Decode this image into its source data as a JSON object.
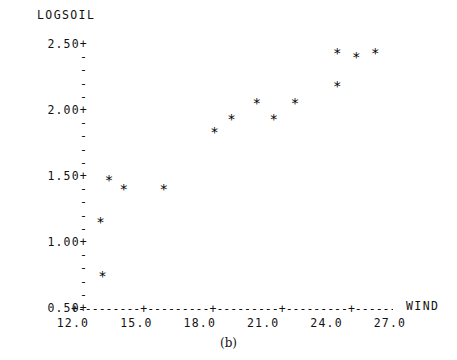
{
  "chart_data": {
    "type": "scatter",
    "title": "",
    "xlabel": "WIND",
    "ylabel": "LOGSOIL",
    "xlim": [
      12.0,
      27.0
    ],
    "ylim": [
      0.5,
      2.5
    ],
    "grid": false,
    "legend": null,
    "point_marker": "*",
    "x": [
      13.4,
      13.3,
      13.7,
      14.4,
      16.3,
      18.7,
      19.5,
      20.7,
      21.5,
      22.5,
      24.5,
      24.5,
      25.4,
      26.3
    ],
    "y": [
      0.74,
      1.15,
      1.47,
      1.4,
      1.4,
      1.83,
      1.93,
      2.05,
      1.93,
      2.05,
      2.18,
      2.43,
      2.4,
      2.43
    ],
    "points": [
      {
        "x": 13.4,
        "y": 0.74
      },
      {
        "x": 13.3,
        "y": 1.15
      },
      {
        "x": 13.7,
        "y": 1.47
      },
      {
        "x": 14.4,
        "y": 1.4
      },
      {
        "x": 16.3,
        "y": 1.4
      },
      {
        "x": 18.7,
        "y": 1.83
      },
      {
        "x": 19.5,
        "y": 1.93
      },
      {
        "x": 20.7,
        "y": 2.05
      },
      {
        "x": 21.5,
        "y": 1.93
      },
      {
        "x": 22.5,
        "y": 2.05
      },
      {
        "x": 24.5,
        "y": 2.18
      },
      {
        "x": 24.5,
        "y": 2.43
      },
      {
        "x": 25.4,
        "y": 2.4
      },
      {
        "x": 26.3,
        "y": 2.43
      }
    ],
    "xticks": [
      12.0,
      15.0,
      18.0,
      21.0,
      24.0,
      27.0
    ],
    "xticklabels": [
      "12.0",
      "15.0",
      "18.0",
      "21.0",
      "24.0",
      "27.0"
    ],
    "yticks": [
      2.5,
      2.0,
      1.5,
      1.0,
      0.5
    ],
    "yticklabels": [
      "2.50+",
      "2.00+",
      "1.50+",
      "1.00+",
      "0.50+"
    ],
    "y_minor_tick_glyph": "-",
    "y_minor_ticks_between_majors": 4,
    "x_axis_rule": "+---------+---------+---------+---------+---------+",
    "caption": "(b)",
    "colors": {
      "background": "#ffffff",
      "foreground": "#111111",
      "marker": "#000000"
    }
  }
}
